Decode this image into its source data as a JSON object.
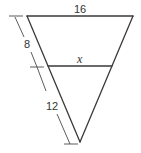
{
  "diagram": {
    "type": "geometry",
    "labels": {
      "top_side": "16",
      "parallel_segment": "x",
      "upper_left_part": "8",
      "lower_left_part": "12"
    },
    "colors": {
      "stroke": "#3a3a3a",
      "background": "#ffffff"
    }
  }
}
